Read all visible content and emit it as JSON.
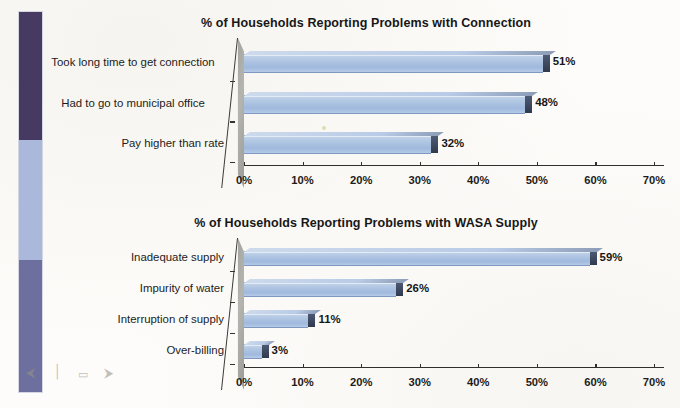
{
  "page": {
    "background_color": "#fdfcfa",
    "sidebar": {
      "name": "decorative-color-strip",
      "bands": [
        {
          "label": "dark-purple-band",
          "color": "#463a63"
        },
        {
          "label": "periwinkle-band",
          "color": "#aab8dc"
        },
        {
          "label": "slate-purple-band",
          "color": "#6d6f9e"
        }
      ]
    },
    "scan_marks": [
      {
        "name": "arrow-left-mark",
        "glyph": "⮜"
      },
      {
        "name": "slash-mark",
        "glyph": "╱"
      },
      {
        "name": "capsule-mark",
        "glyph": "▭"
      },
      {
        "name": "arrow-right-mark",
        "glyph": "⮞"
      }
    ]
  },
  "colors": {
    "bar_fill": "#aec4e2",
    "bar_edge": "#3e4a61",
    "wall_gray": "#a3a39f",
    "axis": "#2f2f2d",
    "text": "#1b1b1b"
  },
  "chart_data": [
    {
      "id": "connection-problems",
      "type": "bar",
      "orientation": "horizontal",
      "title": "% of Households Reporting Problems with Connection",
      "xlabel": "",
      "ylabel": "",
      "xlim": [
        0,
        70
      ],
      "xticks": [
        0,
        10,
        20,
        30,
        40,
        50,
        60,
        70
      ],
      "xticklabels": [
        "0%",
        "10%",
        "20%",
        "30%",
        "40%",
        "50%",
        "60%",
        "70%"
      ],
      "grid": false,
      "legend": false,
      "categories": [
        "Took long time to get connection",
        "Had to go to municipal office",
        "Pay higher than rate"
      ],
      "values": [
        51,
        48,
        32
      ],
      "data_labels": [
        "51%",
        "48%",
        "32%"
      ]
    },
    {
      "id": "wasa-supply-problems",
      "type": "bar",
      "orientation": "horizontal",
      "title": "% of Households Reporting Problems with WASA Supply",
      "xlabel": "",
      "ylabel": "",
      "xlim": [
        0,
        70
      ],
      "xticks": [
        0,
        10,
        20,
        30,
        40,
        50,
        60,
        70
      ],
      "xticklabels": [
        "0%",
        "10%",
        "20%",
        "30%",
        "40%",
        "50%",
        "60%",
        "70%"
      ],
      "grid": false,
      "legend": false,
      "categories": [
        "Inadequate supply",
        "Impurity of water",
        "Interruption of supply",
        "Over-billing"
      ],
      "values": [
        59,
        26,
        11,
        3
      ],
      "data_labels": [
        "59%",
        "26%",
        "11%",
        "3%"
      ]
    }
  ]
}
